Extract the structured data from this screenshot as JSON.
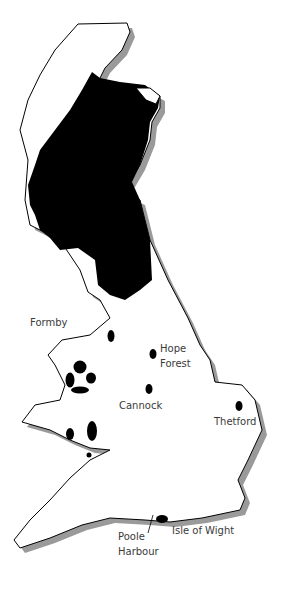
{
  "map": {
    "title": "",
    "region": "Great Britain",
    "colors": {
      "land": "#ffffff",
      "outline": "#000000",
      "shadow": "#9a9a9a",
      "highlight": "#000000"
    },
    "labels": [
      {
        "id": "formby",
        "text": "Formby"
      },
      {
        "id": "hope-forest-1",
        "text": "Hope"
      },
      {
        "id": "hope-forest-2",
        "text": "Forest"
      },
      {
        "id": "cannock",
        "text": "Cannock"
      },
      {
        "id": "thetford",
        "text": "Thetford"
      },
      {
        "id": "isle-of-wight",
        "text": "Isle of Wight"
      },
      {
        "id": "poole-1",
        "text": "Poole"
      },
      {
        "id": "poole-2",
        "text": "Harbour"
      }
    ]
  }
}
